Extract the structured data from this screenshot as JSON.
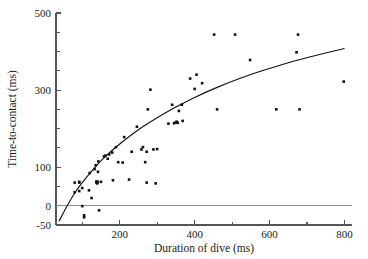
{
  "chart_data": {
    "type": "scatter",
    "title": "",
    "xlabel": "Duration of dive (ms)",
    "ylabel": "Time-to-contact (ms)",
    "xlim": [
      30,
      820
    ],
    "ylim": [
      -50,
      500
    ],
    "xticks": [
      200,
      400,
      600,
      800
    ],
    "xtick_labels": [
      "200",
      "400",
      "600",
      "800"
    ],
    "xminor_ticks": [
      100,
      300,
      500,
      700
    ],
    "yticks": [
      -50,
      0,
      100,
      300,
      500
    ],
    "ytick_labels": [
      "-50",
      "0",
      "100",
      "300",
      "500"
    ],
    "yminor_ticks": [
      50,
      150,
      200,
      250,
      350,
      400,
      450
    ],
    "grid": false,
    "legend": null,
    "zero_reference_line": 0,
    "series": [
      {
        "name": "dive observations",
        "marker": "filled-square",
        "color": "#111111",
        "points": [
          [
            80,
            60
          ],
          [
            80,
            35
          ],
          [
            92,
            62
          ],
          [
            92,
            60
          ],
          [
            92,
            38
          ],
          [
            100,
            46
          ],
          [
            100,
            -1
          ],
          [
            105,
            -25
          ],
          [
            105,
            -30
          ],
          [
            118,
            40
          ],
          [
            120,
            85
          ],
          [
            125,
            20
          ],
          [
            133,
            95
          ],
          [
            136,
            105
          ],
          [
            138,
            63
          ],
          [
            138,
            60
          ],
          [
            140,
            58
          ],
          [
            140,
            60
          ],
          [
            141,
            62
          ],
          [
            142,
            88
          ],
          [
            143,
            115
          ],
          [
            145,
            -12
          ],
          [
            150,
            62
          ],
          [
            158,
            128
          ],
          [
            162,
            130
          ],
          [
            168,
            122
          ],
          [
            172,
            133
          ],
          [
            180,
            138
          ],
          [
            182,
            66
          ],
          [
            190,
            152
          ],
          [
            196,
            113
          ],
          [
            208,
            112
          ],
          [
            212,
            178
          ],
          [
            225,
            68
          ],
          [
            232,
            140
          ],
          [
            246,
            205
          ],
          [
            258,
            146
          ],
          [
            262,
            152
          ],
          [
            268,
            113
          ],
          [
            272,
            140
          ],
          [
            272,
            60
          ],
          [
            275,
            250
          ],
          [
            282,
            301
          ],
          [
            290,
            146
          ],
          [
            296,
            58
          ],
          [
            300,
            147
          ],
          [
            330,
            213
          ],
          [
            340,
            262
          ],
          [
            345,
            214
          ],
          [
            350,
            216
          ],
          [
            352,
            218
          ],
          [
            355,
            215
          ],
          [
            358,
            246
          ],
          [
            366,
            262
          ],
          [
            368,
            220
          ],
          [
            388,
            330
          ],
          [
            400,
            303
          ],
          [
            405,
            340
          ],
          [
            420,
            318
          ],
          [
            452,
            444
          ],
          [
            460,
            250
          ],
          [
            508,
            444
          ],
          [
            548,
            378
          ],
          [
            618,
            250
          ],
          [
            672,
            398
          ],
          [
            676,
            444
          ],
          [
            680,
            250
          ],
          [
            798,
            322
          ]
        ]
      }
    ],
    "fit_curve": {
      "name": "fitted logarithmic trend",
      "color": "#111111",
      "points": [
        [
          38,
          -40
        ],
        [
          60,
          0
        ],
        [
          80,
          33
        ],
        [
          100,
          60
        ],
        [
          130,
          95
        ],
        [
          160,
          126
        ],
        [
          200,
          160
        ],
        [
          250,
          197
        ],
        [
          300,
          228
        ],
        [
          350,
          256
        ],
        [
          400,
          281
        ],
        [
          460,
          307
        ],
        [
          520,
          330
        ],
        [
          580,
          350
        ],
        [
          650,
          371
        ],
        [
          720,
          389
        ],
        [
          800,
          408
        ]
      ]
    }
  }
}
